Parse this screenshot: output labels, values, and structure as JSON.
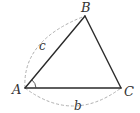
{
  "figure": {
    "type": "triangle",
    "vertices": {
      "A": {
        "label": "A"
      },
      "B": {
        "label": "B"
      },
      "C": {
        "label": "C"
      }
    },
    "sides": {
      "c": {
        "label": "c",
        "between": [
          "A",
          "B"
        ]
      },
      "b": {
        "label": "b",
        "between": [
          "A",
          "C"
        ]
      }
    },
    "marked_angle": "A",
    "colors": {
      "side_stroke": "#2a2a2a",
      "dashed_arc": "#b0b0b0",
      "label": "#333333"
    }
  }
}
